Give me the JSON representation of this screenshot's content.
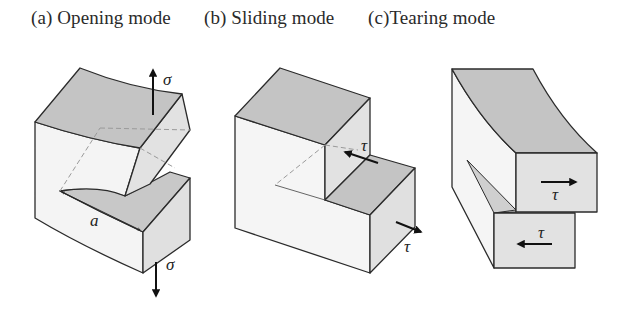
{
  "panels": [
    {
      "id": "a",
      "title": "(a) Opening mode",
      "mode": "Opening",
      "load_symbol": "σ",
      "crack_length_label": "a",
      "arrows": [
        "up",
        "down"
      ]
    },
    {
      "id": "b",
      "title": "(b) Sliding mode",
      "mode": "Sliding",
      "load_symbol": "τ",
      "arrows": [
        "in-plane shear back-left",
        "in-plane shear front-right"
      ]
    },
    {
      "id": "c",
      "title": "(c)Tearing mode",
      "mode": "Tearing",
      "load_symbol": "τ",
      "arrows": [
        "right",
        "left"
      ]
    }
  ],
  "colors": {
    "top_face": "#c4c4c4",
    "side_face": "#e0e0e0",
    "front_face": "#f4f4f4",
    "edge": "#2b2b2b",
    "hidden_edge": "#9a9a9a",
    "arrow": "#111111"
  }
}
